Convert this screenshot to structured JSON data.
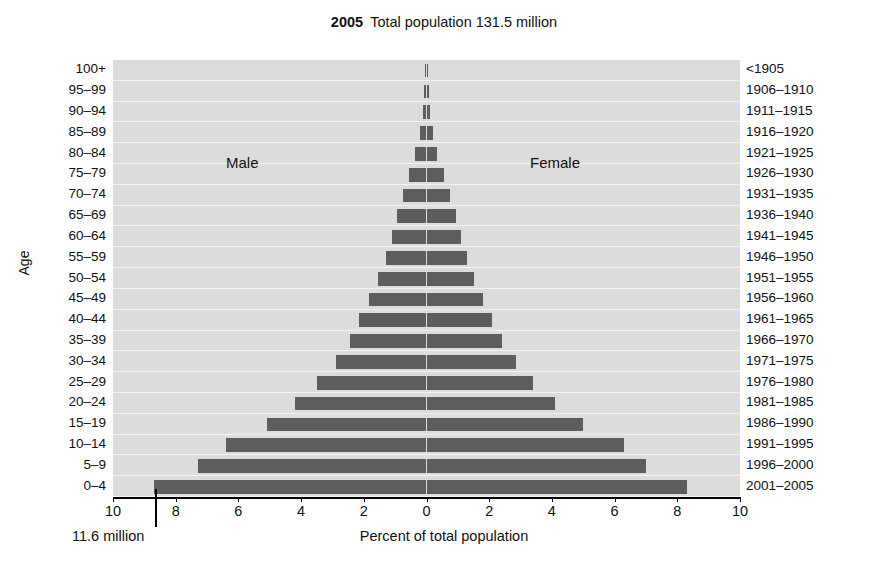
{
  "title": {
    "year": "2005",
    "subtitle": "Total population 131.5 million"
  },
  "axis": {
    "y_left_title": "Age",
    "y_right_title": "Date of birth",
    "x_title": "Percent of total population",
    "x_ticks": [
      "10",
      "8",
      "6",
      "4",
      "2",
      "0",
      "2",
      "4",
      "6",
      "8",
      "10"
    ],
    "annotation": "11.6 million"
  },
  "legend": {
    "male": "Male",
    "female": "Female"
  },
  "chart_data": {
    "type": "bar",
    "xlabel": "Percent of total population",
    "ylabel": "Age",
    "y2label": "Date of birth",
    "xlim": [
      -10,
      10
    ],
    "xticks": [
      10,
      8,
      6,
      4,
      2,
      0,
      2,
      4,
      6,
      8,
      10
    ],
    "grid": true,
    "legend_position": "inside-top",
    "annotation": "11.6 million",
    "categories": [
      "100+",
      "95–99",
      "90–94",
      "85–89",
      "80–84",
      "75–79",
      "70–74",
      "65–69",
      "60–64",
      "55–59",
      "50–54",
      "45–49",
      "40–44",
      "35–39",
      "30–34",
      "25–29",
      "20–24",
      "15–19",
      "10–14",
      "5–9",
      "0–4"
    ],
    "date_of_birth": [
      "<1905",
      "1906–1910",
      "1911–1915",
      "1916–1920",
      "1921–1925",
      "1926–1930",
      "1931–1935",
      "1936–1940",
      "1941–1945",
      "1946–1950",
      "1951–1955",
      "1956–1960",
      "1961–1965",
      "1966–1970",
      "1971–1975",
      "1976–1980",
      "1981–1985",
      "1986–1990",
      "1991–1995",
      "1996–2000",
      "2001–2005"
    ],
    "series": [
      {
        "name": "Male",
        "values": [
          0.05,
          0.08,
          0.12,
          0.2,
          0.38,
          0.55,
          0.75,
          0.95,
          1.1,
          1.3,
          1.55,
          1.85,
          2.15,
          2.45,
          2.9,
          3.5,
          4.2,
          5.1,
          6.4,
          7.3,
          8.7
        ]
      },
      {
        "name": "Female",
        "values": [
          0.05,
          0.08,
          0.12,
          0.2,
          0.35,
          0.55,
          0.75,
          0.95,
          1.1,
          1.3,
          1.5,
          1.8,
          2.1,
          2.4,
          2.85,
          3.4,
          4.1,
          5.0,
          6.3,
          7.0,
          8.3
        ]
      }
    ]
  },
  "style": {
    "bar_color": "#5d5d5d",
    "plot_background": "#dcdcdc",
    "gridline_color": "#f3f3f3",
    "axis_color": "#000000"
  }
}
